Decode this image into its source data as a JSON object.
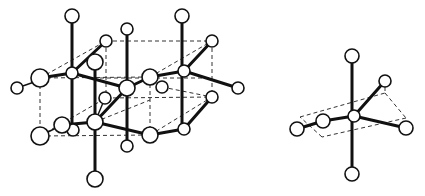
{
  "figure": {
    "panels": [
      {
        "name": "extended-lattice",
        "description": "Ball-and-stick crystal lattice with dashed unit cell outlines",
        "atom_count": 24
      },
      {
        "name": "coordination-octahedron",
        "description": "Single octahedral coordination unit with dashed equatorial plane",
        "atom_count": 7
      }
    ],
    "colors": {
      "background": "#ffffff",
      "line": "#111111",
      "atom_fill": "#ffffff"
    }
  }
}
